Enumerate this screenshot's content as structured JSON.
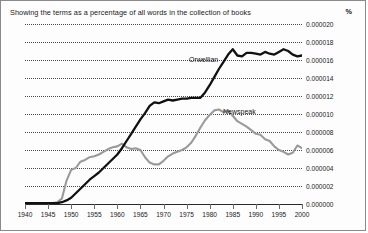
{
  "chart": {
    "title": "Showing the terms as a percentage of all words in the collection of books",
    "unit_label": "%"
  },
  "chart_data": {
    "type": "line",
    "title": "Showing the terms as a percentage of all words in the collection of books",
    "subtitle": "",
    "xlabel": "",
    "ylabel": "%",
    "xlim": [
      1940,
      2000
    ],
    "ylim": [
      0,
      2e-05
    ],
    "grid": true,
    "legend": "inline-annotations",
    "xticks": [
      1940,
      1945,
      1950,
      1955,
      1960,
      1965,
      1970,
      1975,
      1980,
      1985,
      1990,
      1995,
      2000
    ],
    "xtick_labels": [
      "1940",
      "1945",
      "1950",
      "1955",
      "1960",
      "1965",
      "1970",
      "1975",
      "1980",
      "1985",
      "1990",
      "1995",
      "2000"
    ],
    "yticks": [
      0.0,
      2e-06,
      4e-06,
      6e-06,
      8e-06,
      1e-05,
      1.2e-05,
      1.4e-05,
      1.6e-05,
      1.8e-05,
      2e-05
    ],
    "ytick_labels": [
      "0.000000",
      "0.000002",
      "0.000004",
      "0.000006",
      "0.000008",
      "0.000010",
      "0.000012",
      "0.000014",
      "0.000016",
      "0.000018",
      "0.000020"
    ],
    "colors": {
      "orwellian": "#111111",
      "newspeak": "#9a9a9a"
    },
    "series": [
      {
        "name": "Orwellian",
        "color": "#111111",
        "x": [
          1940,
          1942,
          1944,
          1946,
          1947,
          1948,
          1949,
          1950,
          1951,
          1952,
          1953,
          1954,
          1955,
          1956,
          1957,
          1958,
          1959,
          1960,
          1961,
          1962,
          1963,
          1964,
          1965,
          1966,
          1967,
          1968,
          1969,
          1970,
          1971,
          1972,
          1973,
          1974,
          1975,
          1976,
          1977,
          1978,
          1979,
          1980,
          1981,
          1982,
          1983,
          1984,
          1985,
          1986,
          1987,
          1988,
          1989,
          1990,
          1991,
          1992,
          1993,
          1994,
          1995,
          1996,
          1997,
          1998,
          1999,
          2000
        ],
        "values": [
          1e-07,
          1e-07,
          1e-07,
          1e-07,
          1e-07,
          2e-07,
          4e-07,
          7e-07,
          1.2e-06,
          1.7e-06,
          2.2e-06,
          2.7e-06,
          3.1e-06,
          3.5e-06,
          4e-06,
          4.5e-06,
          5e-06,
          5.5e-06,
          6.2e-06,
          7e-06,
          7.8e-06,
          8.6e-06,
          9.4e-06,
          1.01e-05,
          1.09e-05,
          1.13e-05,
          1.12e-05,
          1.14e-05,
          1.16e-05,
          1.15e-05,
          1.16e-05,
          1.17e-05,
          1.17e-05,
          1.18e-05,
          1.18e-05,
          1.18e-05,
          1.24e-05,
          1.32e-05,
          1.41e-05,
          1.5e-05,
          1.58e-05,
          1.66e-05,
          1.72e-05,
          1.65e-05,
          1.64e-05,
          1.68e-05,
          1.68e-05,
          1.67e-05,
          1.66e-05,
          1.69e-05,
          1.67e-05,
          1.66e-05,
          1.69e-05,
          1.72e-05,
          1.7e-05,
          1.66e-05,
          1.64e-05,
          1.65e-05
        ]
      },
      {
        "name": "Newspeak",
        "color": "#9a9a9a",
        "x": [
          1940,
          1942,
          1944,
          1946,
          1947,
          1948,
          1949,
          1950,
          1951,
          1952,
          1953,
          1954,
          1955,
          1956,
          1957,
          1958,
          1959,
          1960,
          1961,
          1962,
          1963,
          1964,
          1965,
          1966,
          1967,
          1968,
          1969,
          1970,
          1971,
          1972,
          1973,
          1974,
          1975,
          1976,
          1977,
          1978,
          1979,
          1980,
          1981,
          1982,
          1983,
          1984,
          1985,
          1986,
          1987,
          1988,
          1989,
          1990,
          1991,
          1992,
          1993,
          1994,
          1995,
          1996,
          1997,
          1998,
          1999,
          2000
        ],
        "values": [
          1e-07,
          1e-07,
          1e-07,
          1e-07,
          2e-07,
          6e-07,
          2.6e-06,
          3.8e-06,
          4e-06,
          4.7e-06,
          4.9e-06,
          5.2e-06,
          5.3e-06,
          5.5e-06,
          5.8e-06,
          6.1e-06,
          6.3e-06,
          6.4e-06,
          6.7e-06,
          6.3e-06,
          6.1e-06,
          6.2e-06,
          6e-06,
          5.2e-06,
          4.6e-06,
          4.4e-06,
          4.4e-06,
          4.8e-06,
          5.3e-06,
          5.6e-06,
          5.8e-06,
          6e-06,
          6.3e-06,
          6.8e-06,
          7.6e-06,
          8.5e-06,
          9.3e-06,
          9.9e-06,
          1.04e-05,
          1.05e-05,
          1.02e-05,
          1.04e-05,
          9.8e-06,
          9.2e-06,
          8.9e-06,
          8.6e-06,
          8.2e-06,
          7.8e-06,
          7.7e-06,
          7.2e-06,
          7e-06,
          6.4e-06,
          6e-06,
          5.8e-06,
          5.5e-06,
          5.7e-06,
          6.5e-06,
          6.2e-06
        ]
      }
    ],
    "annotations": [
      {
        "text": "Orwellian",
        "near_x": 1980,
        "near_y": 1.75e-05
      },
      {
        "text": "Newspeak",
        "near_x": 1987,
        "near_y": 1.18e-05
      }
    ]
  }
}
